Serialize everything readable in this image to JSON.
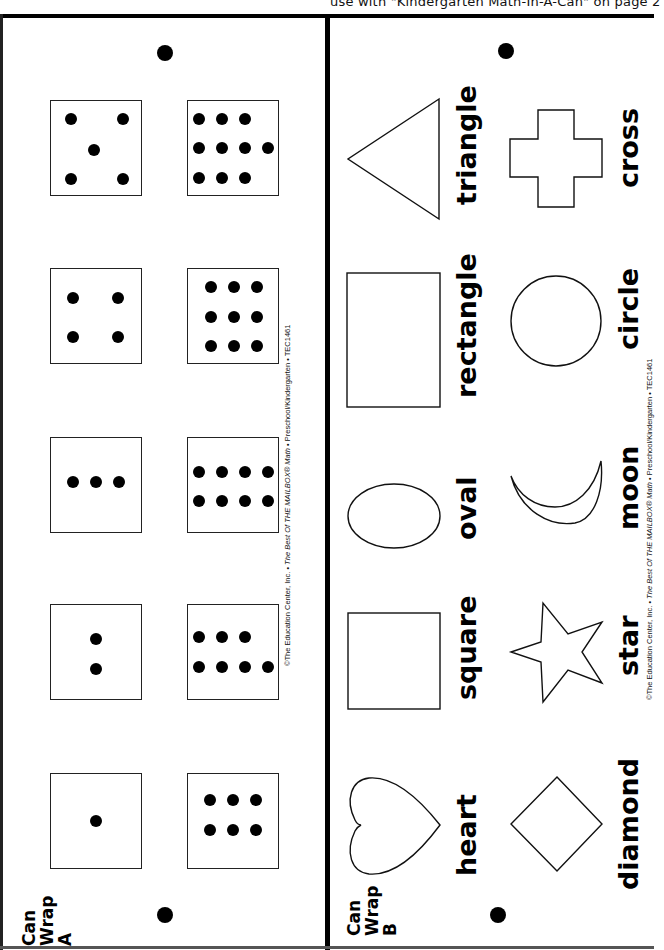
{
  "header": {
    "text": "use with \"Kindergarten Math-In-A-Can\" on page 2"
  },
  "panel_a": {
    "title_line1": "Can",
    "title_line2": "Wrap",
    "title_line3": "A",
    "copyright": {
      "prefix": "©The Education Center, Inc. • ",
      "italic": "The Best Of THE MAILBOX® Math",
      "suffix": " • Preschool/Kindergarten • TEC1461"
    },
    "dice": [
      {
        "count": 1
      },
      {
        "count": 2
      },
      {
        "count": 3
      },
      {
        "count": 4
      },
      {
        "count": 5
      },
      {
        "count": 6
      },
      {
        "count": 7
      },
      {
        "count": 8
      },
      {
        "count": 9
      },
      {
        "count": 10
      }
    ]
  },
  "panel_b": {
    "title_line1": "Can",
    "title_line2": "Wrap",
    "title_line3": "B",
    "copyright": {
      "prefix": "©The Education Center, Inc. • ",
      "italic": "The Best Of THE MAILBOX® Math",
      "suffix": " • Preschool/Kindergarten • TEC1461"
    },
    "shapes": [
      {
        "name": "heart",
        "label": "heart"
      },
      {
        "name": "square",
        "label": "square"
      },
      {
        "name": "oval",
        "label": "oval"
      },
      {
        "name": "rectangle",
        "label": "rectangle"
      },
      {
        "name": "triangle",
        "label": "triangle"
      },
      {
        "name": "diamond",
        "label": "diamond"
      },
      {
        "name": "star",
        "label": "star"
      },
      {
        "name": "moon",
        "label": "moon"
      },
      {
        "name": "circle",
        "label": "circle"
      },
      {
        "name": "cross",
        "label": "cross"
      }
    ]
  }
}
